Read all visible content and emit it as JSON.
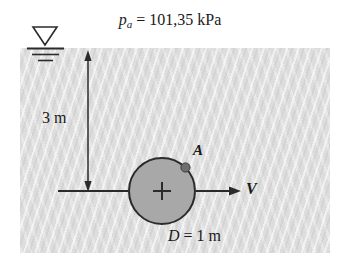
{
  "figure": {
    "name": "submerged-cylinder-flow-diagram",
    "background_color": "#ffffff",
    "fluid_color": "#dddddd",
    "cylinder_fill_color": "#a8a8a8",
    "line_color": "#2b2b2b"
  },
  "labels": {
    "pressure": {
      "variable": "p",
      "subscript": "a",
      "equals": "=",
      "value": "101,35",
      "unit": "kPa"
    },
    "depth": "3 m",
    "point": "A",
    "velocity": "V",
    "diameter": {
      "variable": "D",
      "equals": "=",
      "value": "1",
      "unit": "m"
    }
  },
  "geometry": {
    "free_surface_symbol": "inverted-triangle-with-hatch-lines",
    "depth_dimension": "double-headed-vertical-arrow",
    "velocity_arrow": "rightward-arrow",
    "cylinder_center_mark": "+"
  }
}
